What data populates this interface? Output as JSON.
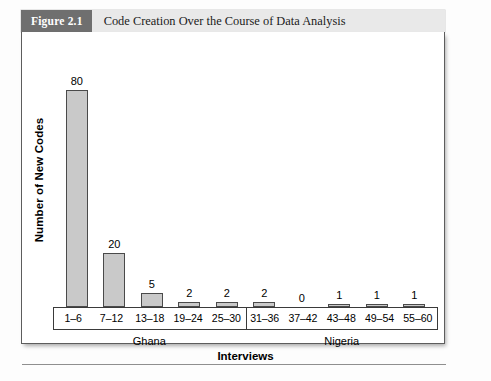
{
  "figure": {
    "badge": "Figure 2.1",
    "title": "Code Creation Over the Course of Data Analysis"
  },
  "chart_data": {
    "type": "bar",
    "title": "Code Creation Over the Course of Data Analysis",
    "xlabel": "Interviews",
    "ylabel": "Number of New Codes",
    "categories": [
      "1–6",
      "7–12",
      "13–18",
      "19–24",
      "25–30",
      "31–36",
      "37–42",
      "43–48",
      "49–54",
      "55–60"
    ],
    "values": [
      80,
      20,
      5,
      2,
      2,
      2,
      0,
      1,
      1,
      1
    ],
    "value_labels": [
      "80",
      "20",
      "5",
      "2",
      "2",
      "2",
      "0",
      "1",
      "1",
      "1"
    ],
    "groups": [
      {
        "label": "Ghana",
        "categories": [
          "1–6",
          "7–12",
          "13–18",
          "19–24",
          "25–30"
        ]
      },
      {
        "label": "Nigeria",
        "categories": [
          "31–36",
          "37–42",
          "43–48",
          "49–54",
          "55–60"
        ]
      }
    ],
    "ylim": [
      0,
      88
    ],
    "grid": false,
    "legend": "none",
    "bar_fill": "#c9c9c9",
    "bar_stroke": "#4a4a4a"
  },
  "style": {
    "badge_bg": "#6f6f6f",
    "header_bg": "#e9e9e9",
    "frame": "#5d5d5d"
  }
}
